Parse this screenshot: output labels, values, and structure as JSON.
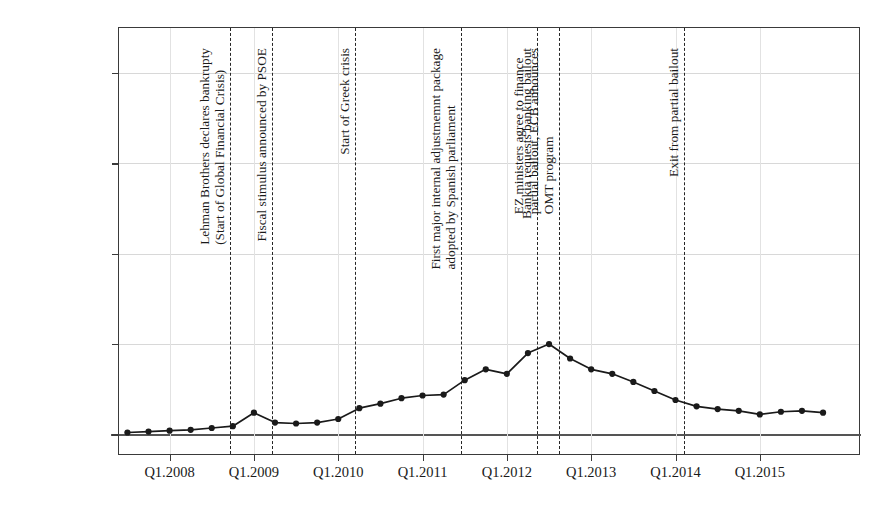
{
  "chart_data": {
    "type": "line",
    "title": "",
    "xlabel": "",
    "ylabel_line1": "Interest rate differentials (% per annum)",
    "ylabel_line2": "Spanish 10Y govt. bonds vs. German 10Y govt. bonds",
    "ytick_labels": [
      "0%",
      "5%",
      "10%",
      "15%",
      "20%"
    ],
    "ytick_values": [
      0,
      5,
      10,
      15,
      20
    ],
    "ylim": [
      -1.2,
      22.5
    ],
    "xtick_labels": [
      "Q1.2008",
      "Q1.2009",
      "Q1.2010",
      "Q1.2011",
      "Q1.2012",
      "Q1.2013",
      "Q1.2014",
      "Q1.2015"
    ],
    "xtick_values": [
      2008.0,
      2009.0,
      2010.0,
      2011.0,
      2012.0,
      2013.0,
      2014.0,
      2015.0
    ],
    "xlim": [
      2007.4,
      2016.2
    ],
    "grid": "horizontal-and-vertical-light",
    "legend": "none",
    "series": [
      {
        "name": "Spanish-German 10Y spread",
        "marker": "filled-circle",
        "color": "#1a1a1a",
        "x": [
          2007.5,
          2007.75,
          2008.0,
          2008.25,
          2008.5,
          2008.75,
          2009.0,
          2009.25,
          2009.5,
          2009.75,
          2010.0,
          2010.25,
          2010.5,
          2010.75,
          2011.0,
          2011.25,
          2011.5,
          2011.75,
          2012.0,
          2012.25,
          2012.5,
          2012.75,
          2013.0,
          2013.25,
          2013.5,
          2013.75,
          2014.0,
          2014.25,
          2014.5,
          2014.75,
          2015.0,
          2015.25,
          2015.5,
          2015.75
        ],
        "x_labels": [
          "Q3.2007",
          "Q4.2007",
          "Q1.2008",
          "Q2.2008",
          "Q3.2008",
          "Q4.2008",
          "Q1.2009",
          "Q2.2009",
          "Q3.2009",
          "Q4.2009",
          "Q1.2010",
          "Q2.2010",
          "Q3.2010",
          "Q4.2010",
          "Q1.2011",
          "Q2.2011",
          "Q3.2011",
          "Q4.2011",
          "Q1.2012",
          "Q2.2012",
          "Q3.2012",
          "Q4.2012",
          "Q1.2013",
          "Q2.2013",
          "Q3.2013",
          "Q4.2013",
          "Q1.2014",
          "Q2.2014",
          "Q3.2014",
          "Q4.2014",
          "Q1.2015",
          "Q2.2015",
          "Q3.2015",
          "Q4.2015"
        ],
        "y": [
          0.1,
          0.15,
          0.2,
          0.25,
          0.35,
          0.45,
          1.2,
          0.65,
          0.6,
          0.65,
          0.85,
          1.45,
          1.7,
          2.0,
          2.15,
          2.2,
          3.0,
          3.6,
          3.35,
          4.5,
          5.0,
          4.2,
          3.6,
          3.35,
          2.9,
          2.4,
          1.9,
          1.55,
          1.4,
          1.3,
          1.1,
          1.25,
          1.3,
          1.2
        ]
      }
    ],
    "annotations": [
      {
        "id": "lehman",
        "x": 2008.72,
        "lines": [
          "Lehman Brothers declares bankrupty",
          "(Start of Global Financial Crisis)"
        ]
      },
      {
        "id": "fiscal-stimulus",
        "x": 2009.22,
        "lines": [
          "Fiscal stimulus announced by PSOE"
        ]
      },
      {
        "id": "greek-crisis",
        "x": 2010.2,
        "lines": [
          "Start of Greek crisis"
        ]
      },
      {
        "id": "adjustment-package",
        "x": 2011.46,
        "lines": [
          "First major internal adjustmemnt package",
          "adopted by Spanish parliament"
        ]
      },
      {
        "id": "bankia-bailout",
        "x": 2012.36,
        "lines": [
          "Bankia requests banking bailout"
        ]
      },
      {
        "id": "ez-ministers-omt",
        "x": 2012.62,
        "lines": [
          "EZ ministers agree to finance",
          "partial bailout, ECB announces",
          "OMT program"
        ]
      },
      {
        "id": "exit-bailout",
        "x": 2014.1,
        "lines": [
          "Exit from partial bailout"
        ]
      }
    ]
  }
}
